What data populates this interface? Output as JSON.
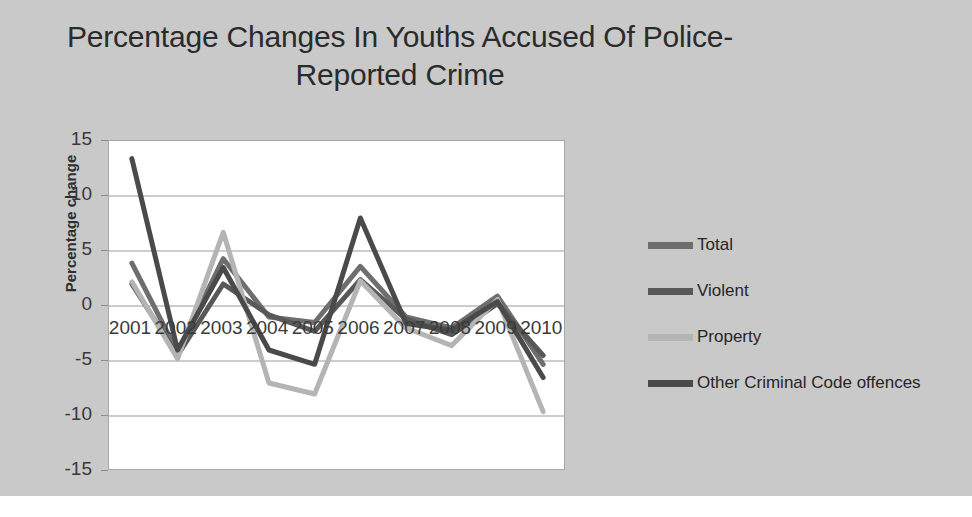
{
  "chart_data": {
    "type": "line",
    "title": "Percentage Changes In Youths Accused Of Police-Reported Crime",
    "xlabel": "",
    "ylabel": "Percentage change",
    "categories": [
      "2001",
      "2002",
      "2003",
      "2004",
      "2005",
      "2006",
      "2007",
      "2008",
      "2009",
      "2010"
    ],
    "ylim": [
      -15,
      15
    ],
    "yticks": [
      "15",
      "10",
      "5",
      "0",
      "-5",
      "-10",
      "-15"
    ],
    "grid": true,
    "legend_position": "right",
    "series": [
      {
        "name": "Total",
        "color": "#6e6e6e",
        "values": [
          3.9,
          -4.2,
          4.3,
          -1.0,
          -1.5,
          3.6,
          -1.0,
          -2.0,
          0.9,
          -5.3
        ]
      },
      {
        "name": "Violent",
        "color": "#585858",
        "values": [
          2.0,
          -4.5,
          2.0,
          -0.8,
          -2.3,
          2.4,
          -1.2,
          -2.6,
          0.2,
          -4.5
        ]
      },
      {
        "name": "Property",
        "color": "#b4b4b4",
        "values": [
          2.2,
          -4.8,
          6.7,
          -7.0,
          -8.0,
          2.3,
          -2.0,
          -3.6,
          0.6,
          -9.6
        ]
      },
      {
        "name": "Other Criminal Code offences",
        "color": "#4a4a4a",
        "values": [
          13.4,
          -4.0,
          3.5,
          -4.0,
          -5.3,
          8.0,
          -1.6,
          -2.2,
          0.4,
          -6.5
        ]
      }
    ]
  },
  "legend": {
    "items": [
      {
        "label": "Total"
      },
      {
        "label": "Violent"
      },
      {
        "label": "Property"
      },
      {
        "label": "Other Criminal Code offences"
      }
    ]
  },
  "colors": {
    "background": "#c9c9c9",
    "plot_background": "#ffffff",
    "gridline": "#9a9a9a",
    "text": "#2b2b2b"
  }
}
